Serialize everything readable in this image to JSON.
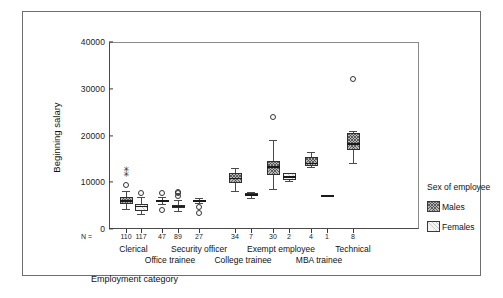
{
  "figure": {
    "y_axis_title": "Beginning salary",
    "x_axis_title": "Employment category",
    "n_prefix": "N ="
  },
  "legend": {
    "title": "Sex of employee",
    "entries": [
      {
        "label": "Males",
        "swatch": "males-swatch"
      },
      {
        "label": "Females",
        "swatch": "females-swatch"
      }
    ]
  },
  "chart_data": {
    "type": "box",
    "title": "",
    "xlabel": "Employment category",
    "ylabel": "Beginning salary",
    "ylim": [
      0,
      40000
    ],
    "ytick_labels": [
      "0",
      "10000",
      "20000",
      "30000",
      "40000"
    ],
    "yticks": [
      0,
      10000,
      20000,
      30000,
      40000
    ],
    "grid": false,
    "legend_position": "right",
    "categories": [
      "Clerical",
      "Office trainee",
      "Security officer",
      "College trainee",
      "Exempt employee",
      "MBA trainee",
      "Technical"
    ],
    "group_labels": [
      "Males",
      "Females"
    ],
    "boxes": [
      {
        "category": "Clerical",
        "sex": "Males",
        "n": 110,
        "whisker_low": 4200,
        "q1": 5400,
        "median": 6000,
        "q3": 6800,
        "whisker_high": 8100,
        "outliers": [
          9500
        ],
        "extremes": [
          11600,
          12600
        ]
      },
      {
        "category": "Clerical",
        "sex": "Females",
        "n": 117,
        "whisker_low": 3300,
        "q1": 3900,
        "median": 4800,
        "q3": 5400,
        "whisker_high": 6900,
        "outliers": [
          7800
        ],
        "extremes": []
      },
      {
        "category": "Office trainee",
        "sex": "Males",
        "n": 47,
        "whisker_low": 5400,
        "q1": 5800,
        "median": 6000,
        "q3": 6300,
        "whisker_high": 6800,
        "outliers": [
          4100,
          7600
        ],
        "extremes": []
      },
      {
        "category": "Office trainee",
        "sex": "Females",
        "n": 89,
        "whisker_low": 3900,
        "q1": 4400,
        "median": 4800,
        "q3": 5200,
        "whisker_high": 6200,
        "outliers": [
          7100,
          7600,
          7900
        ],
        "extremes": []
      },
      {
        "category": "Security officer",
        "sex": "Males",
        "n": 27,
        "whisker_low": 5500,
        "q1": 5800,
        "median": 6000,
        "q3": 6200,
        "whisker_high": 6600,
        "outliers": [
          4600,
          3400
        ],
        "extremes": []
      },
      {
        "category": "College trainee",
        "sex": "Males",
        "n": 34,
        "whisker_low": 8200,
        "q1": 9800,
        "median": 10800,
        "q3": 12000,
        "whisker_high": 13100,
        "outliers": [],
        "extremes": []
      },
      {
        "category": "College trainee",
        "sex": "Females",
        "n": 7,
        "whisker_low": 6700,
        "q1": 7000,
        "median": 7300,
        "q3": 7700,
        "whisker_high": 8000,
        "outliers": [],
        "extremes": []
      },
      {
        "category": "Exempt employee",
        "sex": "Males",
        "n": 30,
        "whisker_low": 8500,
        "q1": 11500,
        "median": 13200,
        "q3": 14600,
        "whisker_high": 19000,
        "outliers": [
          24000
        ],
        "extremes": []
      },
      {
        "category": "Exempt employee",
        "sex": "Females",
        "n": 2,
        "whisker_low": 10300,
        "q1": 10400,
        "median": 11100,
        "q3": 12000,
        "whisker_high": 12000,
        "outliers": [],
        "extremes": []
      },
      {
        "category": "MBA trainee",
        "sex": "Males",
        "n": 4,
        "whisker_low": 13200,
        "q1": 13500,
        "median": 14000,
        "q3": 15500,
        "whisker_high": 16500,
        "outliers": [],
        "extremes": []
      },
      {
        "category": "MBA trainee",
        "sex": "Females",
        "n": 1,
        "whisker_low": 7200,
        "q1": 7200,
        "median": 7200,
        "q3": 7200,
        "whisker_high": 7200,
        "outliers": [],
        "extremes": []
      },
      {
        "category": "Technical",
        "sex": "Males",
        "n": 8,
        "whisker_low": 14200,
        "q1": 17000,
        "median": 18200,
        "q3": 20500,
        "whisker_high": 21000,
        "outliers": [
          32000
        ],
        "extremes": []
      }
    ]
  },
  "colors": {
    "male_fill": "#b9b9b9",
    "female_fill": "#f4f4f4",
    "line": "#2f2f2f",
    "frame": "#6d6d6d"
  }
}
